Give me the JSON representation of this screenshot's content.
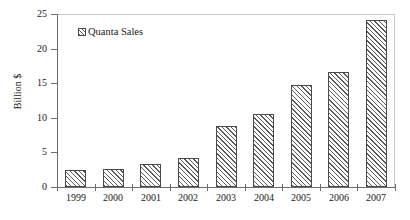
{
  "chart_data": {
    "type": "bar",
    "title": "",
    "subtitle": "",
    "xlabel": "",
    "ylabel": "Billion $",
    "categories": [
      "1999",
      "2000",
      "2001",
      "2002",
      "2003",
      "2004",
      "2005",
      "2006",
      "2007"
    ],
    "series": [
      {
        "name": "Quanta Sales",
        "values": [
          2.5,
          2.6,
          3.3,
          4.2,
          8.8,
          10.6,
          14.7,
          16.6,
          24.1
        ]
      }
    ],
    "ylim": [
      0,
      25
    ],
    "yticks": [
      0,
      5,
      10,
      15,
      20,
      25
    ],
    "ytick_labels": [
      "0",
      "5",
      "10",
      "15",
      "20",
      "25"
    ],
    "grid": false,
    "legend_position": "top-left",
    "legend_entries": [
      "Quanta Sales"
    ],
    "annotations": [],
    "colors": {
      "bar_fill": "#ffffff",
      "bar_hatch": "#5d5d5d",
      "bar_outline": "#4a4a4a",
      "axis": "#6d6d6d",
      "frame": "#c9c9c9",
      "text": "#1a1a1a",
      "background": "#ffffff"
    }
  },
  "legend": {
    "swatch_icon": "hatched-square-icon",
    "label": "Quanta Sales"
  }
}
